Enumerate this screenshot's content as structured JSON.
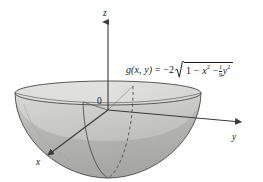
{
  "figure": {
    "type": "3d-surface-plot",
    "background_color": "#ffffff",
    "line_color": "#3a3a3a",
    "surface_outer_color": "#b4b4b4",
    "surface_inner_color": "#dededc",
    "rim_band_color": "#cfcfcd",
    "axes": {
      "z": {
        "label": "z",
        "direction": "up"
      },
      "y": {
        "label": "y",
        "direction": "right"
      },
      "x": {
        "label": "x",
        "direction": "down-left"
      },
      "origin_label": "0"
    },
    "formula": {
      "function_name": "g",
      "arguments": "(x, y)",
      "equals": "=",
      "coefficient": "−2",
      "radical": "√",
      "radicand_first": "1",
      "minus_1": "−",
      "term_x": "x",
      "exponent_x": "2",
      "minus_2": "−",
      "fraction_numerator": "1",
      "fraction_denominator": "9",
      "term_y": "y",
      "exponent_y": "2",
      "plain_text": "g(x, y) = −2√(1 − x² − (1/9)y²)"
    }
  }
}
